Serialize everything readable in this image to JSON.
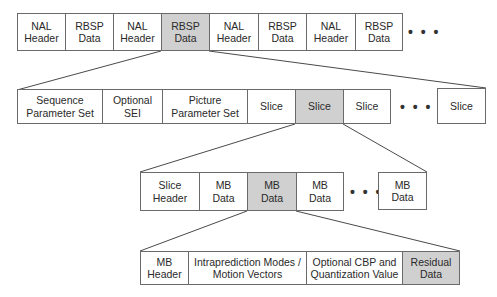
{
  "diagram": {
    "highlight_color": "#d0d0d0",
    "border_color": "#6a6a6a",
    "ellipsis": "• • •",
    "rows": [
      {
        "name": "nal-unit-stream",
        "cells": [
          {
            "label": "NAL\nHeader",
            "highlighted": false
          },
          {
            "label": "RBSP\nData",
            "highlighted": false
          },
          {
            "label": "NAL\nHeader",
            "highlighted": false
          },
          {
            "label": "RBSP\nData",
            "highlighted": true
          },
          {
            "label": "NAL\nHeader",
            "highlighted": false
          },
          {
            "label": "RBSP\nData",
            "highlighted": false
          },
          {
            "label": "NAL\nHeader",
            "highlighted": false
          },
          {
            "label": "RBSP\nData",
            "highlighted": false
          }
        ]
      },
      {
        "name": "rbsp-contents",
        "cells": [
          {
            "label": "Sequence\nParameter Set",
            "highlighted": false
          },
          {
            "label": "Optional\nSEI",
            "highlighted": false
          },
          {
            "label": "Picture\nParameter Set",
            "highlighted": false
          },
          {
            "label": "Slice",
            "highlighted": false
          },
          {
            "label": "Slice",
            "highlighted": true
          },
          {
            "label": "Slice",
            "highlighted": false
          },
          {
            "label": "Slice",
            "highlighted": false
          }
        ]
      },
      {
        "name": "slice-contents",
        "cells": [
          {
            "label": "Slice\nHeader",
            "highlighted": false
          },
          {
            "label": "MB\nData",
            "highlighted": false
          },
          {
            "label": "MB\nData",
            "highlighted": true
          },
          {
            "label": "MB\nData",
            "highlighted": false
          },
          {
            "label": "MB\nData",
            "highlighted": false
          }
        ]
      },
      {
        "name": "macroblock-contents",
        "cells": [
          {
            "label": "MB\nHeader",
            "highlighted": false
          },
          {
            "label": "Intraprediction Modes /\nMotion Vectors",
            "highlighted": false
          },
          {
            "label": "Optional CBP and\nQuantization Value",
            "highlighted": false
          },
          {
            "label": "Residual\nData",
            "highlighted": true
          }
        ]
      }
    ]
  }
}
